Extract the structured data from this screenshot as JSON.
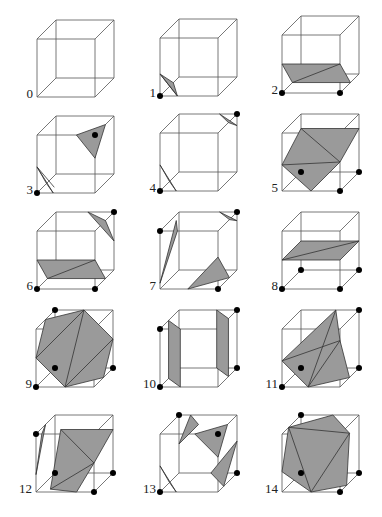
{
  "style": {
    "face_fill": "#9a9a9a",
    "edge_color": "#555555",
    "dot_color": "#000000"
  },
  "cube": {
    "size": 58,
    "depth_dx": 19,
    "depth_dy": -19
  },
  "cases": [
    {
      "label": "0",
      "origin": [
        37,
        97
      ],
      "dots": [],
      "polys": [],
      "lines": []
    },
    {
      "label": "1",
      "origin": [
        160,
        96
      ],
      "dots": [
        [
          0,
          0,
          0
        ]
      ],
      "polys": [
        [
          [
            0.3,
            0,
            0
          ],
          [
            0,
            0.38,
            0
          ],
          [
            0,
            0,
            0.7
          ]
        ]
      ],
      "lines": [
        [
          [
            0.3,
            0,
            0
          ],
          [
            0,
            0.38,
            0
          ]
        ]
      ]
    },
    {
      "label": "2",
      "origin": [
        282,
        93
      ],
      "dots": [
        [
          0,
          0,
          0
        ],
        [
          1,
          0,
          0
        ]
      ],
      "polys": [
        [
          [
            0,
            0.5,
            0
          ],
          [
            1,
            0.5,
            0
          ],
          [
            1,
            0,
            0.55
          ],
          [
            0,
            0,
            0.55
          ]
        ]
      ],
      "lines": [
        [
          [
            0,
            0,
            0.55
          ],
          [
            1,
            0.5,
            0
          ]
        ]
      ]
    },
    {
      "label": "3",
      "origin": [
        37,
        193
      ],
      "dots": [
        [
          0,
          0,
          0
        ],
        [
          1,
          1,
          0
        ]
      ],
      "polys": [
        [
          [
            0,
            0.45,
            0
          ],
          [
            0.28,
            0,
            0
          ],
          [
            0,
            0,
            0.5
          ]
        ],
        [
          [
            0.68,
            1,
            0
          ],
          [
            1,
            0.6,
            0
          ],
          [
            1,
            1,
            0.55
          ]
        ]
      ],
      "lines": [
        [
          [
            0,
            0.45,
            0
          ],
          [
            0.2,
            0,
            0.3
          ]
        ]
      ]
    },
    {
      "label": "4",
      "origin": [
        160,
        191
      ],
      "dots": [
        [
          0,
          0,
          0
        ],
        [
          1,
          1,
          1
        ]
      ],
      "polys": [
        [
          [
            0,
            0.45,
            0
          ],
          [
            0.28,
            0,
            0
          ],
          [
            0,
            0,
            0.5
          ]
        ],
        [
          [
            0.7,
            1,
            1
          ],
          [
            1,
            0.8,
            1
          ],
          [
            1,
            1,
            0.55
          ]
        ]
      ],
      "lines": []
    },
    {
      "label": "5",
      "origin": [
        282,
        191
      ],
      "dots": [
        [
          0,
          0,
          1
        ],
        [
          1,
          0,
          1
        ],
        [
          1,
          0,
          0
        ]
      ],
      "polys": [
        [
          [
            0,
            0.45,
            0
          ],
          [
            0.5,
            0,
            0
          ],
          [
            1,
            0.5,
            0
          ],
          [
            1,
            0.75,
            1
          ],
          [
            0,
            0.75,
            1
          ]
        ]
      ],
      "lines": [
        [
          [
            0,
            0.75,
            1
          ],
          [
            1,
            0.5,
            0
          ]
        ],
        [
          [
            0,
            0.45,
            0
          ],
          [
            1,
            0.5,
            0
          ]
        ]
      ]
    },
    {
      "label": "6",
      "origin": [
        37,
        289
      ],
      "dots": [
        [
          0,
          0,
          0
        ],
        [
          1,
          0,
          0
        ],
        [
          1,
          1,
          1
        ]
      ],
      "polys": [
        [
          [
            0,
            0.5,
            0
          ],
          [
            1,
            0.5,
            0
          ],
          [
            1,
            0,
            0.55
          ],
          [
            0,
            0,
            0.55
          ]
        ],
        [
          [
            0.55,
            1,
            1
          ],
          [
            1,
            1,
            0.55
          ],
          [
            1,
            0.5,
            1
          ]
        ]
      ],
      "lines": [
        [
          [
            0,
            0,
            0.55
          ],
          [
            1,
            0.5,
            0
          ]
        ]
      ]
    },
    {
      "label": "7",
      "origin": [
        160,
        289
      ],
      "dots": [
        [
          0,
          1,
          0
        ],
        [
          1,
          0,
          0
        ],
        [
          1,
          1,
          1
        ]
      ],
      "polys": [
        [
          [
            0,
            0.1,
            0
          ],
          [
            0.3,
            1,
            0
          ],
          [
            0.1,
            1,
            0.55
          ]
        ],
        [
          [
            0.48,
            0,
            0
          ],
          [
            1,
            0,
            0.6
          ],
          [
            1,
            0.55,
            0
          ]
        ],
        [
          [
            0.7,
            1,
            1
          ],
          [
            1,
            1,
            0.6
          ],
          [
            1,
            0.85,
            1
          ]
        ]
      ],
      "lines": []
    },
    {
      "label": "8",
      "origin": [
        282,
        289
      ],
      "dots": [
        [
          0,
          0,
          0
        ],
        [
          1,
          0,
          0
        ],
        [
          0,
          0,
          1
        ],
        [
          1,
          0,
          1
        ]
      ],
      "polys": [
        [
          [
            0,
            0.5,
            0
          ],
          [
            1,
            0.5,
            0
          ],
          [
            1,
            0.5,
            1
          ],
          [
            0,
            0.5,
            1
          ]
        ]
      ],
      "lines": [
        [
          [
            0,
            0.5,
            0
          ],
          [
            1,
            0.5,
            1
          ]
        ]
      ]
    },
    {
      "label": "9",
      "origin": [
        36,
        387
      ],
      "dots": [
        [
          0,
          0,
          0
        ],
        [
          0,
          0,
          1
        ],
        [
          1,
          0,
          1
        ],
        [
          0,
          1,
          1
        ]
      ],
      "polys": [
        [
          [
            0,
            0.5,
            0
          ],
          [
            0.5,
            0,
            0
          ],
          [
            1,
            0,
            0.5
          ],
          [
            1,
            0.5,
            1
          ],
          [
            0.5,
            1,
            1
          ],
          [
            0,
            1,
            0.5
          ]
        ]
      ],
      "lines": [
        [
          [
            0,
            0.5,
            0
          ],
          [
            0.5,
            1,
            1
          ]
        ],
        [
          [
            0.5,
            0,
            0
          ],
          [
            0.5,
            1,
            1
          ]
        ],
        [
          [
            0.5,
            0,
            0
          ],
          [
            1,
            0.5,
            1
          ]
        ]
      ]
    },
    {
      "label": "10",
      "origin": [
        160,
        387
      ],
      "dots": [
        [
          0,
          0,
          0
        ],
        [
          0,
          1,
          0
        ],
        [
          1,
          0,
          1
        ],
        [
          1,
          1,
          1
        ]
      ],
      "polys": [
        [
          [
            0.35,
            0,
            0
          ],
          [
            0.35,
            1,
            0
          ],
          [
            0,
            1,
            0.45
          ],
          [
            0,
            0,
            0.45
          ]
        ],
        [
          [
            0.65,
            0,
            1
          ],
          [
            0.65,
            1,
            1
          ],
          [
            1,
            1,
            0.55
          ],
          [
            1,
            0,
            0.55
          ]
        ]
      ],
      "lines": []
    },
    {
      "label": "11",
      "origin": [
        282,
        387
      ],
      "dots": [
        [
          0,
          0,
          0
        ],
        [
          0,
          0,
          1
        ],
        [
          1,
          0,
          1
        ],
        [
          1,
          1,
          1
        ]
      ],
      "polys": [
        [
          [
            0,
            0.45,
            0
          ],
          [
            0.45,
            0,
            0
          ],
          [
            1,
            0,
            0.5
          ],
          [
            1,
            0.8,
            0
          ],
          [
            0.6,
            1,
            1
          ]
        ]
      ],
      "lines": [
        [
          [
            0,
            0.45,
            0
          ],
          [
            1,
            0.8,
            0
          ]
        ],
        [
          [
            0.45,
            0,
            0
          ],
          [
            1,
            0.8,
            0
          ]
        ],
        [
          [
            0.45,
            0,
            0
          ],
          [
            0.6,
            1,
            1
          ]
        ]
      ]
    },
    {
      "label": "12",
      "origin": [
        36,
        492
      ],
      "dots": [
        [
          0,
          1,
          0
        ],
        [
          1,
          0,
          0
        ],
        [
          0,
          0,
          1
        ],
        [
          1,
          0,
          1
        ]
      ],
      "polys": [
        [
          [
            0,
            0.3,
            0
          ],
          [
            0,
            1,
            0.5
          ],
          [
            0.1,
            1,
            0
          ]
        ],
        [
          [
            0.2,
            0,
            0.15
          ],
          [
            0.7,
            0,
            0
          ],
          [
            1,
            0.5,
            0
          ],
          [
            1,
            0.75,
            1
          ],
          [
            0.1,
            0.75,
            1
          ]
        ]
      ],
      "lines": [
        [
          [
            0.1,
            0.75,
            1
          ],
          [
            1,
            0.5,
            0
          ]
        ],
        [
          [
            0.2,
            0,
            0.15
          ],
          [
            1,
            0.5,
            0
          ]
        ]
      ]
    },
    {
      "label": "13",
      "origin": [
        160,
        492
      ],
      "dots": [
        [
          0,
          0,
          0
        ],
        [
          0,
          1,
          1
        ],
        [
          1,
          1,
          0
        ],
        [
          1,
          0,
          1
        ]
      ],
      "polys": [
        [
          [
            0,
            0.45,
            0
          ],
          [
            0.28,
            0,
            0
          ],
          [
            0,
            0,
            0.5
          ]
        ],
        [
          [
            0.2,
            1,
            1
          ],
          [
            0.5,
            1,
            0.5
          ],
          [
            0,
            0.5,
            1
          ]
        ],
        [
          [
            0.6,
            1,
            0
          ],
          [
            1,
            0.6,
            0
          ],
          [
            1,
            1,
            0.5
          ]
        ],
        [
          [
            0.55,
            0,
            1
          ],
          [
            1,
            0.55,
            1
          ],
          [
            1,
            0,
            0.3
          ]
        ]
      ],
      "lines": []
    },
    {
      "label": "14",
      "origin": [
        282,
        492
      ],
      "dots": [
        [
          1,
          0,
          0
        ],
        [
          0,
          0,
          1
        ],
        [
          1,
          0,
          1
        ],
        [
          0,
          1,
          1
        ]
      ],
      "polys": [
        [
          [
            0,
            0.35,
            0
          ],
          [
            0.5,
            0,
            0
          ],
          [
            1,
            0,
            0.35
          ],
          [
            1,
            0.85,
            0.5
          ],
          [
            0.55,
            1,
            1
          ],
          [
            0,
            1,
            0.35
          ]
        ]
      ],
      "lines": [
        [
          [
            0,
            1,
            0.35
          ],
          [
            1,
            0.85,
            0.5
          ]
        ],
        [
          [
            0,
            1,
            0.35
          ],
          [
            0.5,
            0,
            0
          ]
        ],
        [
          [
            0.5,
            0,
            0
          ],
          [
            1,
            0.85,
            0.5
          ]
        ]
      ]
    }
  ]
}
